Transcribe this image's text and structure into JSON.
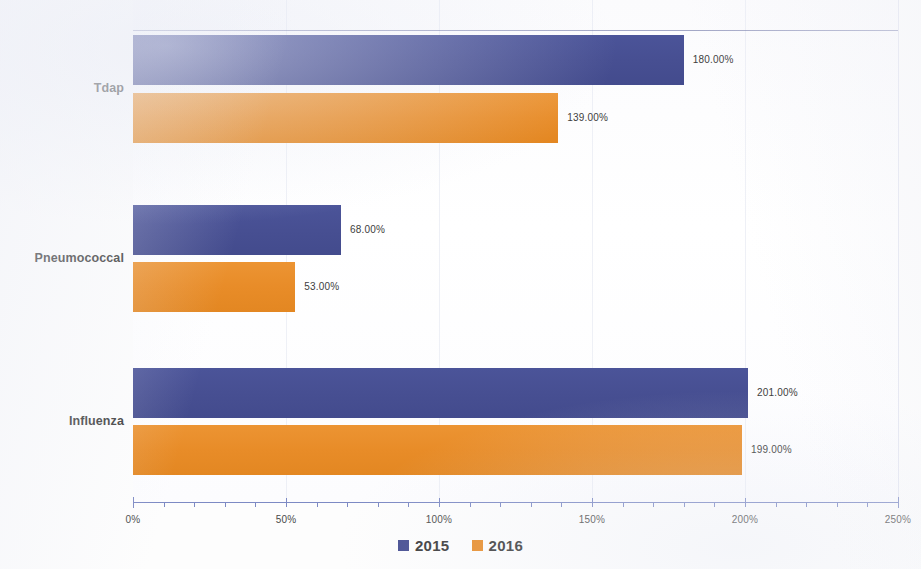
{
  "chart_data": {
    "type": "bar",
    "orientation": "horizontal",
    "title": "",
    "subtitle": "",
    "xlabel": "",
    "ylabel": "",
    "categories": [
      "Tdap",
      "Pneumococcal",
      "Influenza"
    ],
    "series": [
      {
        "name": "2015",
        "color": "#474f92",
        "values": [
          180,
          68,
          201
        ],
        "labels": [
          "180.00%",
          "68.00%",
          "201.00%"
        ]
      },
      {
        "name": "2016",
        "color": "#e88c28",
        "values": [
          139,
          53,
          199
        ],
        "labels": [
          "139.00%",
          "53.00%",
          "199.00%"
        ]
      }
    ],
    "xlim": [
      0,
      250
    ],
    "xtick_values": [
      0,
      50,
      100,
      150,
      200,
      250
    ],
    "xtick_labels": [
      "0%",
      "50%",
      "100%",
      "150%",
      "200%",
      "250%"
    ],
    "minor_tick_step": 10,
    "grid": "vertical-faint",
    "legend_position": "bottom-center",
    "value_labels_shown": true,
    "value_label_format": "0.00%"
  },
  "legend": {
    "items": [
      {
        "label": "2015",
        "color": "#474f92"
      },
      {
        "label": "2016",
        "color": "#e88c28"
      }
    ]
  },
  "axis": {
    "x_ticks": [
      {
        "label": "0%",
        "value": 0
      },
      {
        "label": "50%",
        "value": 50
      },
      {
        "label": "100%",
        "value": 100
      },
      {
        "label": "150%",
        "value": 150
      },
      {
        "label": "200%",
        "value": 200
      },
      {
        "label": "250%",
        "value": 250
      }
    ]
  },
  "categories": [
    {
      "label": "Tdap"
    },
    {
      "label": "Pneumococcal"
    },
    {
      "label": "Influenza"
    }
  ],
  "bars": [
    {
      "category": "Tdap",
      "series": "2015",
      "value": 180,
      "label": "180.00%"
    },
    {
      "category": "Tdap",
      "series": "2016",
      "value": 139,
      "label": "139.00%"
    },
    {
      "category": "Pneumococcal",
      "series": "2015",
      "value": 68,
      "label": "68.00%"
    },
    {
      "category": "Pneumococcal",
      "series": "2016",
      "value": 53,
      "label": "53.00%"
    },
    {
      "category": "Influenza",
      "series": "2015",
      "value": 201,
      "label": "201.00%"
    },
    {
      "category": "Influenza",
      "series": "2016",
      "value": 199,
      "label": "199.00%"
    }
  ],
  "colors": {
    "series_2015": "#474f92",
    "series_2016": "#e88c28",
    "axis": "#7d8ac4",
    "grid": "#dfe2ee",
    "text": "#3b3b3b",
    "background": "#fdfdfd"
  }
}
